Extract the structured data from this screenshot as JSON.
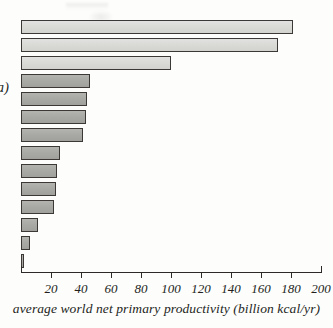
{
  "figure": {
    "panel_label": "a)"
  },
  "chart_data": {
    "type": "bar",
    "orientation": "horizontal",
    "title": "",
    "xlabel": "average world net primary productivity (billion kcal/yr)",
    "ylabel": "",
    "xlim": [
      0,
      200
    ],
    "xticks": [
      20,
      40,
      60,
      80,
      100,
      120,
      140,
      160,
      180,
      200
    ],
    "xtick_labels": [
      "20",
      "40",
      "60",
      "80",
      "100",
      "120",
      "140",
      "160",
      "180",
      "200"
    ],
    "grid": false,
    "legend": "none",
    "categories": [
      "",
      "",
      "",
      "",
      "",
      "",
      "",
      "",
      "",
      "",
      "",
      "",
      "",
      ""
    ],
    "values": [
      181,
      171,
      100,
      46,
      44,
      43,
      41,
      26,
      24,
      23,
      22,
      11,
      6,
      2
    ],
    "bar_shades": [
      "light",
      "light",
      "light",
      "dark",
      "dark",
      "dark",
      "dark",
      "dark",
      "dark",
      "dark",
      "dark",
      "dark",
      "dark",
      "dark"
    ],
    "colors": {
      "bar_light": "#dadad7",
      "bar_dark": "#a9a9a6",
      "bar_outline": "#3b3835",
      "axis": "#2c2926",
      "text": "#231f1c",
      "background": "#fdfdfb"
    }
  }
}
